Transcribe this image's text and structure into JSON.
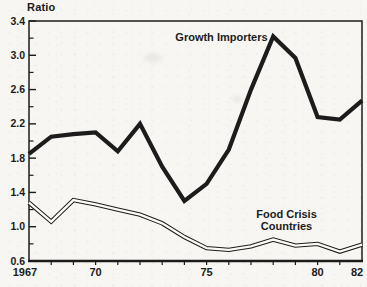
{
  "figure": {
    "ink_color": "#1c1c1c",
    "paper_color": "#f7f6f2",
    "line_inner_color": "#fcfbf8"
  },
  "chart_data": {
    "type": "line",
    "title": "Ratio",
    "xlabel": "",
    "ylabel": "Ratio",
    "xlim": [
      1967,
      1982
    ],
    "ylim": [
      0.6,
      3.4
    ],
    "grid": false,
    "legend_position": "inline-annotations",
    "x": [
      1967,
      1968,
      1969,
      1970,
      1971,
      1972,
      1973,
      1974,
      1975,
      1976,
      1977,
      1978,
      1979,
      1980,
      1981,
      1982
    ],
    "x_tick_labels": [
      {
        "x": 1967,
        "label": "1967"
      },
      {
        "x": 1970,
        "label": "70"
      },
      {
        "x": 1975,
        "label": "75"
      },
      {
        "x": 1980,
        "label": "80"
      },
      {
        "x": 1982,
        "label": "82"
      }
    ],
    "x_minor_tick_years": [
      1968,
      1969,
      1970,
      1971,
      1972,
      1973,
      1974,
      1975,
      1976,
      1977,
      1978,
      1979,
      1980,
      1981
    ],
    "y_major_ticks": [
      0.6,
      1.0,
      1.4,
      1.8,
      2.2,
      2.6,
      3.0,
      3.4
    ],
    "y_minor_ticks": [
      0.8,
      1.2,
      1.6,
      2.0,
      2.4,
      2.8,
      3.2
    ],
    "series": [
      {
        "name": "Growth Importers",
        "line_style": "thick-solid",
        "values": [
          1.85,
          2.05,
          2.08,
          2.1,
          1.88,
          2.2,
          1.7,
          1.3,
          1.5,
          1.9,
          2.6,
          3.22,
          2.97,
          2.28,
          2.25,
          2.47
        ]
      },
      {
        "name": "Food Crisis Countries",
        "line_style": "double-outline",
        "values": [
          1.28,
          1.06,
          1.31,
          1.26,
          1.2,
          1.14,
          1.04,
          0.88,
          0.75,
          0.73,
          0.77,
          0.85,
          0.78,
          0.8,
          0.71,
          0.79
        ]
      }
    ],
    "annotations": [
      {
        "text": "Growth Importers",
        "x": 1977.75,
        "y": 3.17,
        "anchor": "end",
        "size": 11
      },
      {
        "text": "Food Crisis",
        "x": 1978.6,
        "y": 1.1,
        "anchor": "middle",
        "size": 11
      },
      {
        "text": "Countries",
        "x": 1978.6,
        "y": 0.96,
        "anchor": "middle",
        "size": 11
      }
    ]
  }
}
